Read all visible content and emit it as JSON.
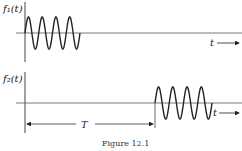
{
  "figure": {
    "caption": "Figure 12.1",
    "top_plot": {
      "ylabel": "f₁(t)",
      "xlabel": "t",
      "signal": {
        "start_x": 25,
        "end_x": 80,
        "cycles": 4
      }
    },
    "bottom_plot": {
      "ylabel": "f₂(t)",
      "xlabel": "t",
      "delay_label": "T",
      "signal": {
        "start_x": 155,
        "end_x": 212,
        "cycles": 4
      }
    },
    "colors": {
      "line": "#222222",
      "axis": "#555555"
    }
  }
}
